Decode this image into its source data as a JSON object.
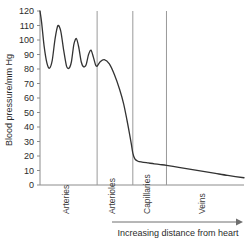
{
  "chart_data": {
    "type": "line",
    "title": "",
    "xlabel": "Increasing distance from heart",
    "ylabel": "Blood pressure/mm Hg",
    "ylim": [
      0,
      120
    ],
    "yticks": [
      0,
      10,
      20,
      30,
      40,
      50,
      60,
      70,
      80,
      90,
      100,
      110,
      120
    ],
    "ytick_labels": [
      "0",
      "10",
      "20",
      "30",
      "40",
      "50",
      "60",
      "70",
      "80",
      "90",
      "100",
      "110",
      "120"
    ],
    "xlim": [
      0,
      100
    ],
    "xticks": [],
    "xtick_labels": [],
    "grid": false,
    "legend": false,
    "axis_arrow": "right",
    "line_color": "#333333",
    "divider_color": "#9a9a9a",
    "axis_color": "#8c8c8c",
    "regions": [
      {
        "label": "Arteries",
        "x_start": 0.0,
        "x_end": 28.0
      },
      {
        "label": "Arterioles",
        "x_start": 28.0,
        "x_end": 45.5
      },
      {
        "label": "Capillaries",
        "x_start": 45.5,
        "x_end": 62.0
      },
      {
        "label": "Veins",
        "x_start": 62.0,
        "x_end": 100.0
      }
    ],
    "region_dividers": [
      28.0,
      45.5,
      62.0
    ],
    "series": [
      {
        "name": "Blood pressure",
        "x": [
          0.0,
          0.8,
          2.0,
          3.4,
          4.6,
          6.0,
          7.4,
          8.8,
          10.2,
          11.6,
          13.0,
          14.2,
          15.4,
          16.6,
          17.8,
          19.0,
          20.2,
          21.4,
          22.6,
          23.8,
          25.0,
          26.2,
          27.2,
          28.0,
          29.5,
          31.5,
          34.0,
          36.5,
          39.0,
          41.0,
          42.6,
          43.8,
          44.8,
          45.5,
          46.5,
          48.0,
          50.0,
          53.0,
          56.0,
          59.0,
          62.0,
          68.0,
          74.0,
          80.0,
          86.0,
          92.0,
          100.0
        ],
        "y": [
          120.0,
          112.0,
          96.0,
          84.0,
          80.5,
          86.0,
          101.0,
          110.0,
          106.0,
          93.0,
          82.0,
          80.5,
          85.0,
          97.0,
          101.0,
          95.0,
          85.0,
          81.5,
          83.0,
          90.0,
          93.0,
          88.0,
          83.0,
          82.0,
          85.0,
          86.5,
          83.5,
          76.0,
          66.0,
          56.0,
          45.0,
          36.0,
          28.0,
          22.0,
          18.0,
          16.4,
          15.8,
          15.2,
          14.6,
          14.1,
          13.6,
          12.2,
          10.8,
          9.4,
          8.0,
          6.6,
          5.0
        ]
      }
    ]
  },
  "layout": {
    "plot_left": 40,
    "plot_right": 244,
    "plot_top": 11,
    "plot_bottom": 185,
    "region_label_baseline": 214,
    "xaxis_line_y": 222,
    "xaxis_label_y": 236
  }
}
